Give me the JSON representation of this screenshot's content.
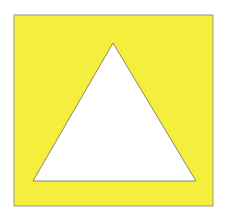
{
  "figure": {
    "background_color": "#ffffff",
    "square": {
      "x": 14,
      "y": 15,
      "width": 199,
      "height": 191,
      "fill": "#f5ee3c",
      "stroke": "#9a9a7a"
    },
    "triangle": {
      "points": "113,43 33,181 196,181",
      "fill": "#ffffff",
      "stroke": "#8a8a6a"
    }
  }
}
